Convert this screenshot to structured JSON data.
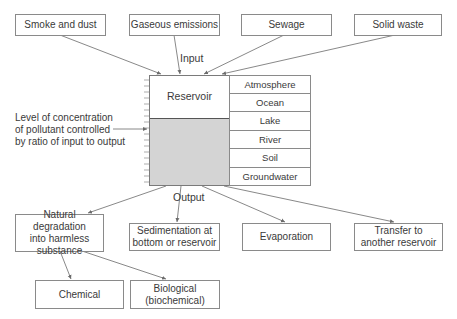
{
  "diagram": {
    "inputs": [
      {
        "label": "Smoke and dust"
      },
      {
        "label": "Gaseous emissions"
      },
      {
        "label": "Sewage"
      },
      {
        "label": "Solid waste"
      }
    ],
    "input_label": "Input",
    "reservoir": {
      "label": "Reservoir",
      "types": [
        "Atmosphere",
        "Ocean",
        "Lake",
        "River",
        "Soil",
        "Groundwater"
      ]
    },
    "level_note": {
      "line1": "Level of concentration",
      "line2": "of pollutant controlled",
      "line3": "by ratio of input to output"
    },
    "output_label": "Output",
    "outputs": [
      {
        "line1": "Natural degradation",
        "line2": "into harmless",
        "line3": "substance"
      },
      {
        "line1": "Sedimentation at",
        "line2": "bottom or reservoir"
      },
      {
        "line1": "Evaporation"
      },
      {
        "line1": "Transfer to",
        "line2": "another reservoir"
      }
    ],
    "degradation_types": [
      {
        "line1": "Chemical"
      },
      {
        "line1": "Biological",
        "line2": "(biochemical)"
      }
    ],
    "colors": {
      "line": "#6a6a6a",
      "box_border": "#8a8a8a",
      "fill": "#d4d4d4"
    }
  }
}
